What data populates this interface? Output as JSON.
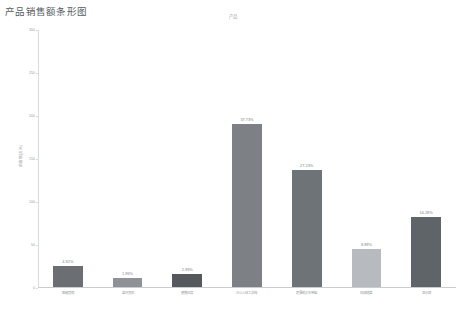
{
  "page": {
    "title": "产品销售额条形图"
  },
  "chart_data": {
    "type": "bar",
    "title": "产品",
    "xlabel": "",
    "ylabel": "销售额(万元)",
    "ylim": [
      0,
      300
    ],
    "grid": false,
    "legend": "none",
    "yticks": [
      "0",
      "50",
      "100",
      "150",
      "200",
      "250",
      "300"
    ],
    "ytick_values": [
      0,
      50,
      100,
      150,
      200,
      250,
      300
    ],
    "categories": [
      "智能音箱",
      "蓝牙耳机",
      "便携风扇",
      "办公人体工学椅",
      "超薄笔记本电脑",
      "机械键盘",
      "显示器"
    ],
    "values": [
      24,
      10,
      15,
      189,
      136,
      44,
      81
    ],
    "data_labels": [
      "4.92%",
      "1.96%",
      "2.99%",
      "37.73%",
      "27.23%",
      "8.89%",
      "16.28%"
    ],
    "colors": [
      "#6b6f74",
      "#8e9297",
      "#55595e",
      "#7d8186",
      "#6e7378",
      "#b7bbbf",
      "#5f6469"
    ]
  }
}
